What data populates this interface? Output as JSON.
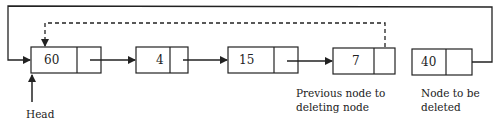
{
  "diagram": {
    "nodes": [
      {
        "value": "60"
      },
      {
        "value": "4"
      },
      {
        "value": "15"
      },
      {
        "value": "7"
      },
      {
        "value": "40"
      }
    ],
    "labels": {
      "head": "Head",
      "previous_line1": "Previous node to",
      "previous_line2": "deleting node",
      "deleted_line1": "Node to be",
      "deleted_line2": "deleted"
    },
    "colors": {
      "line": "#222222",
      "background": "#ffffff"
    }
  }
}
